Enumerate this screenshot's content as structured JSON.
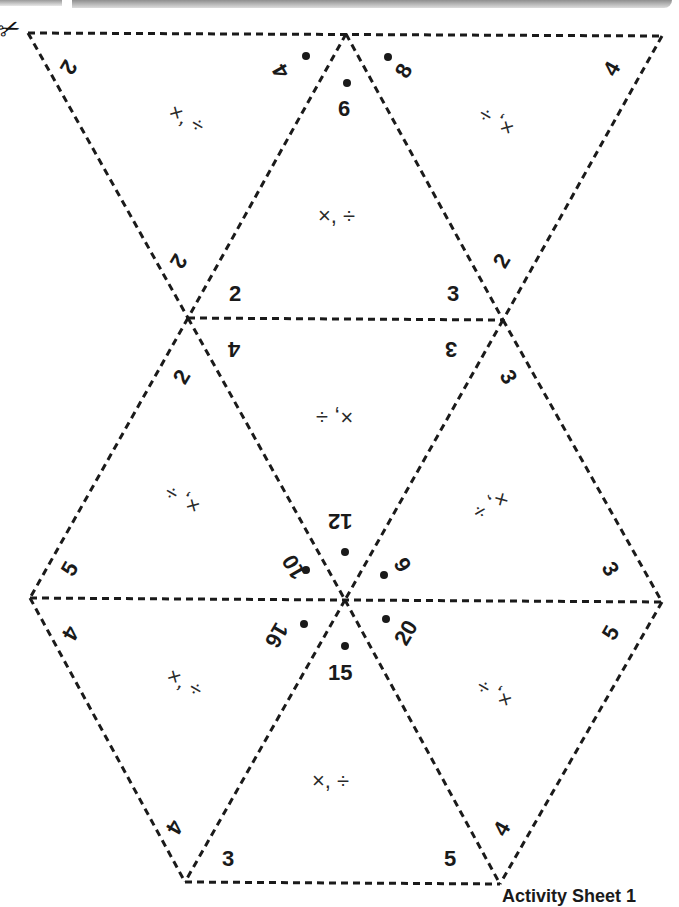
{
  "sheet": {
    "title": "Activity Sheet 1",
    "cut_icon": "scissors-icon",
    "line_style": "dashed",
    "line_color": "#1a1a1a"
  },
  "triangles": [
    {
      "id": "top-left",
      "operations": "×, ÷",
      "corner_numbers": [
        "2",
        "4"
      ]
    },
    {
      "id": "top-center",
      "operations": "×, ÷",
      "corner_numbers": [
        "6",
        "2",
        "3"
      ]
    },
    {
      "id": "top-right",
      "operations": "×, ÷",
      "corner_numbers": [
        "8",
        "4",
        "2"
      ]
    },
    {
      "id": "middle-left",
      "operations": "×, ÷",
      "corner_numbers": [
        "2",
        "5",
        "10"
      ]
    },
    {
      "id": "middle-center",
      "operations": "×, ÷",
      "corner_numbers": [
        "4",
        "3",
        "12"
      ]
    },
    {
      "id": "middle-right",
      "operations": "×, ÷",
      "corner_numbers": [
        "3",
        "3",
        "9"
      ]
    },
    {
      "id": "bottom-left",
      "operations": "×, ÷",
      "corner_numbers": [
        "4",
        "16",
        "4"
      ]
    },
    {
      "id": "bottom-center",
      "operations": "×, ÷",
      "corner_numbers": [
        "15",
        "3",
        "5"
      ]
    },
    {
      "id": "bottom-right",
      "operations": "×, ÷",
      "corner_numbers": [
        "20",
        "5",
        "4"
      ]
    }
  ],
  "labels": {
    "tl_2": "2",
    "tl_4": "4",
    "tl_ops": "×, ÷",
    "tc_6": "6",
    "tc_2": "2",
    "tc_3": "3",
    "tc_ops": "×, ÷",
    "tr_8": "8",
    "tr_4": "4",
    "tr_2": "2",
    "tr_ops": "×, ÷",
    "ml_2": "2",
    "ml_5": "5",
    "ml_10": "10",
    "ml_ops": "×, ÷",
    "mc_4": "4",
    "mc_3": "3",
    "mc_12": "12",
    "mc_ops": "×, ÷",
    "mr_3a": "3",
    "mr_3b": "3",
    "mr_9": "9",
    "mr_ops": "×, ÷",
    "ll_4a": "4",
    "ll_16": "16",
    "ll_4b": "4",
    "ll_ops": "×, ÷",
    "lc_15": "15",
    "lc_3": "3",
    "lc_5": "5",
    "lc_ops": "×, ÷",
    "lr_20": "20",
    "lr_5": "5",
    "lr_4": "4",
    "lr_ops": "×, ÷"
  }
}
